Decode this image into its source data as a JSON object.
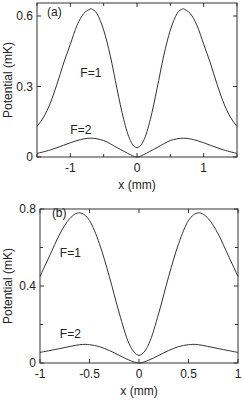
{
  "chart_data": [
    {
      "type": "line",
      "panel_label": "(a)",
      "xlabel": "x (mm)",
      "ylabel": "Potential (mK)",
      "xlim": [
        -1.5,
        1.5
      ],
      "ylim": [
        0,
        0.63
      ],
      "xticks": [
        -1,
        0,
        1
      ],
      "xtick_labels": [
        "-1",
        "0",
        "1"
      ],
      "xminor": [
        -1.5,
        -0.5,
        0.5,
        1.5
      ],
      "yticks": [
        0,
        0.3,
        0.6
      ],
      "ytick_labels": [
        "0",
        "0.3",
        "0.6"
      ],
      "grid": false,
      "series": [
        {
          "name": "F=1",
          "x": [
            -1.5,
            -1.4,
            -1.3,
            -1.2,
            -1.1,
            -1.0,
            -0.9,
            -0.8,
            -0.7,
            -0.68,
            -0.6,
            -0.5,
            -0.4,
            -0.3,
            -0.2,
            -0.1,
            0,
            0.1,
            0.2,
            0.3,
            0.4,
            0.5,
            0.6,
            0.68,
            0.7,
            0.8,
            0.9,
            1.0,
            1.1,
            1.2,
            1.3,
            1.4,
            1.5
          ],
          "values": [
            0.13,
            0.17,
            0.23,
            0.31,
            0.4,
            0.48,
            0.56,
            0.61,
            0.63,
            0.63,
            0.61,
            0.54,
            0.43,
            0.29,
            0.16,
            0.07,
            0.04,
            0.07,
            0.16,
            0.29,
            0.43,
            0.54,
            0.61,
            0.63,
            0.63,
            0.61,
            0.56,
            0.48,
            0.4,
            0.31,
            0.23,
            0.17,
            0.13
          ]
        },
        {
          "name": "F=2",
          "x": [
            -1.5,
            -1.3,
            -1.1,
            -0.9,
            -0.7,
            -0.5,
            -0.3,
            -0.1,
            0,
            0.1,
            0.3,
            0.5,
            0.7,
            0.9,
            1.1,
            1.3,
            1.5
          ],
          "values": [
            0.015,
            0.03,
            0.05,
            0.07,
            0.08,
            0.07,
            0.04,
            0.01,
            0.0,
            0.01,
            0.04,
            0.07,
            0.08,
            0.07,
            0.05,
            0.03,
            0.015
          ]
        }
      ],
      "annotations": [
        {
          "text": "F=1",
          "x": -0.85,
          "y": 0.34
        },
        {
          "text": "F=2",
          "x": -1.0,
          "y": 0.1
        },
        {
          "text": "(a)",
          "x": -1.35,
          "y": 0.6
        }
      ]
    },
    {
      "type": "line",
      "panel_label": "(b)",
      "xlabel": "x (mm)",
      "ylabel": "Potential (mK)",
      "xlim": [
        -1,
        1
      ],
      "ylim": [
        0,
        0.8
      ],
      "xticks": [
        -1,
        -0.5,
        0,
        0.5,
        1
      ],
      "xtick_labels": [
        "-1",
        "-0.5",
        "0",
        "0.5",
        "1"
      ],
      "yticks": [
        0,
        0.4,
        0.8
      ],
      "ytick_labels": [
        "0",
        "0.4",
        "0.8"
      ],
      "yminor": [
        0.2,
        0.6
      ],
      "grid": false,
      "series": [
        {
          "name": "F=1",
          "x": [
            -1.0,
            -0.9,
            -0.8,
            -0.7,
            -0.6,
            -0.5,
            -0.4,
            -0.3,
            -0.2,
            -0.1,
            0,
            0.1,
            0.2,
            0.3,
            0.4,
            0.5,
            0.6,
            0.7,
            0.8,
            0.9,
            1.0
          ],
          "values": [
            0.45,
            0.56,
            0.67,
            0.75,
            0.78,
            0.74,
            0.62,
            0.45,
            0.26,
            0.1,
            0.04,
            0.1,
            0.26,
            0.45,
            0.62,
            0.74,
            0.78,
            0.75,
            0.67,
            0.56,
            0.45
          ]
        },
        {
          "name": "F=2",
          "x": [
            -1.0,
            -0.8,
            -0.6,
            -0.5,
            -0.4,
            -0.3,
            -0.2,
            -0.1,
            0,
            0.1,
            0.2,
            0.3,
            0.4,
            0.5,
            0.6,
            0.8,
            1.0
          ],
          "values": [
            0.055,
            0.075,
            0.095,
            0.095,
            0.085,
            0.065,
            0.04,
            0.015,
            0.0,
            0.015,
            0.04,
            0.065,
            0.085,
            0.095,
            0.095,
            0.075,
            0.055
          ]
        }
      ],
      "annotations": [
        {
          "text": "F=1",
          "x": -0.8,
          "y": 0.55
        },
        {
          "text": "F=2",
          "x": -0.8,
          "y": 0.13
        },
        {
          "text": "(b)",
          "x": -0.88,
          "y": 0.76
        }
      ]
    }
  ]
}
